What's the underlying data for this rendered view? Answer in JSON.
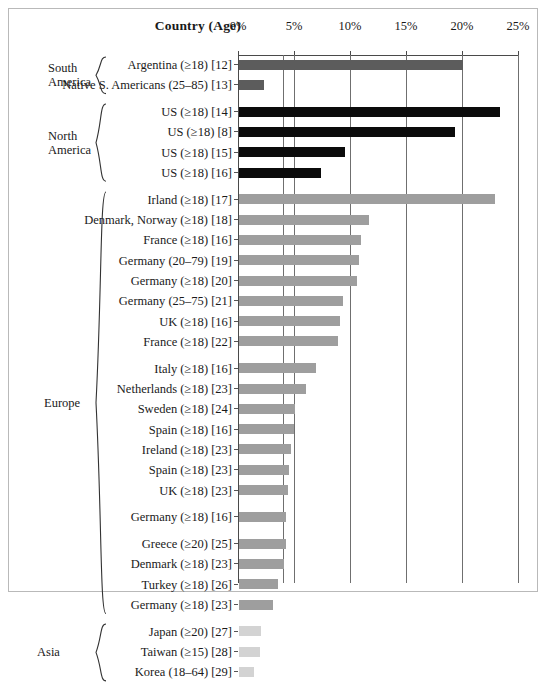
{
  "figure": {
    "country_header": "Country (Age)",
    "axis": {
      "ticks": [
        "0%",
        "5%",
        "10%",
        "15%",
        "20%",
        "25%"
      ],
      "tick_values": [
        0,
        5,
        10,
        15,
        20,
        25
      ],
      "xmin": 0,
      "xmax": 25
    },
    "groups": [
      {
        "name": "South\nAmerica",
        "color": "#5c5c5c",
        "key": "sa"
      },
      {
        "name": "North\nAmerica",
        "color": "#0b0b0b",
        "key": "na"
      },
      {
        "name": "Europe",
        "color": "#9e9e9e",
        "key": "eu"
      },
      {
        "name": "Asia",
        "color": "#d3d3d3",
        "key": "as"
      }
    ]
  },
  "chart_data": {
    "type": "bar",
    "orientation": "horizontal",
    "title": "",
    "xlabel": "",
    "ylabel": "Country (Age)",
    "xlim": [
      0,
      25
    ],
    "xticks": [
      0,
      5,
      10,
      15,
      20,
      25
    ],
    "xticklabels": [
      "0%",
      "5%",
      "10%",
      "15%",
      "20%",
      "25%"
    ],
    "grid": true,
    "legend": "none",
    "categories": [
      "Argentina (≥18) [12]",
      "Native S. Americans (25–85) [13]",
      "US (≥18) [14]",
      "US (≥18) [8]",
      "US (≥18) [15]",
      "US (≥18) [16]",
      "Irland (≥18) [17]",
      "Denmark, Norway (≥18) [18]",
      "France (≥18) [16]",
      "Germany (20–79) [19]",
      "Germany (≥18) [20]",
      "Germany (25–75) [21]",
      "UK (≥18) [16]",
      "France (≥18) [22]",
      "Italy (≥18) [16]",
      "Netherlands (≥18) [23]",
      "Sweden (≥18) [24]",
      "Spain (≥18) [16]",
      "Ireland (≥18) [23]",
      "Spain (≥18) [23]",
      "UK (≥18) [23]",
      "Germany (≥18) [16]",
      "Greece (≥20) [25]",
      "Denmark (≥18) [23]",
      "Turkey (≥18) [26]",
      "Germany (≥18) [23]",
      "Japan (≥20) [27]",
      "Taiwan (≥15) [28]",
      "Korea (18–64) [29]"
    ],
    "values": [
      20.0,
      2.2,
      23.3,
      19.3,
      9.5,
      7.3,
      22.9,
      11.6,
      10.9,
      10.7,
      10.5,
      9.3,
      9.0,
      8.8,
      6.9,
      6.0,
      5.0,
      4.9,
      4.6,
      4.5,
      4.4,
      4.2,
      4.2,
      4.0,
      3.5,
      3.0,
      2.0,
      1.9,
      1.3
    ],
    "group_of": [
      "sa",
      "sa",
      "na",
      "na",
      "na",
      "na",
      "eu",
      "eu",
      "eu",
      "eu",
      "eu",
      "eu",
      "eu",
      "eu",
      "eu",
      "eu",
      "eu",
      "eu",
      "eu",
      "eu",
      "eu",
      "eu",
      "eu",
      "eu",
      "eu",
      "eu",
      "as",
      "as",
      "as"
    ],
    "gaps_after": [
      1,
      5,
      13,
      20,
      21,
      25
    ]
  }
}
